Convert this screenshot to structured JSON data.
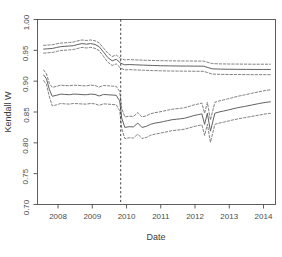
{
  "chart_data": {
    "type": "line",
    "title": "",
    "xlabel": "Date",
    "ylabel": "Kendall W",
    "xlim": [
      2007.4,
      2014.35
    ],
    "ylim": [
      0.7,
      1.0
    ],
    "grid": false,
    "legend": null,
    "x_ticks": [
      2008,
      2009,
      2010,
      2011,
      2012,
      2013,
      2014
    ],
    "x_tick_labels": [
      "2008",
      "2009",
      "2010",
      "2011",
      "2012",
      "2013",
      "2014"
    ],
    "y_ticks": [
      0.7,
      0.75,
      0.8,
      0.85,
      0.9,
      0.95,
      1.0
    ],
    "y_tick_labels": [
      "0.70",
      "0.75",
      "0.80",
      "0.85",
      "0.90",
      "0.95",
      "1.00"
    ],
    "annotations": [
      {
        "type": "vline",
        "x": 2009.83,
        "style": "dashed",
        "color": "#333333"
      }
    ],
    "series": [
      {
        "name": "upper-series-estimate",
        "style": "solid",
        "color": "#5a5a5a",
        "x": [
          2007.58,
          2007.7,
          2007.83,
          2007.95,
          2008.08,
          2008.2,
          2008.33,
          2008.45,
          2008.58,
          2008.7,
          2008.83,
          2008.95,
          2009.08,
          2009.2,
          2009.33,
          2009.45,
          2009.58,
          2009.7,
          2009.83,
          2009.95,
          2010.08,
          2010.25,
          2010.5,
          2010.75,
          2011.0,
          2011.25,
          2011.5,
          2011.75,
          2012.0,
          2012.25,
          2012.5,
          2012.75,
          2013.0,
          2013.25,
          2013.5,
          2013.75,
          2014.0,
          2014.2
        ],
        "y": [
          0.952,
          0.9525,
          0.953,
          0.9545,
          0.956,
          0.9565,
          0.957,
          0.9575,
          0.9595,
          0.961,
          0.96,
          0.961,
          0.9595,
          0.956,
          0.947,
          0.9385,
          0.933,
          0.9355,
          0.929,
          0.9265,
          0.927,
          0.9265,
          0.926,
          0.9255,
          0.925,
          0.9248,
          0.9246,
          0.9245,
          0.9244,
          0.9243,
          0.92,
          0.9195,
          0.9193,
          0.9192,
          0.9191,
          0.919,
          0.919,
          0.919
        ]
      },
      {
        "name": "upper-series-ci-upper",
        "style": "dashed",
        "color": "#6a6a6a",
        "x": [
          2007.58,
          2007.7,
          2007.83,
          2007.95,
          2008.08,
          2008.2,
          2008.33,
          2008.45,
          2008.58,
          2008.7,
          2008.83,
          2008.95,
          2009.08,
          2009.2,
          2009.33,
          2009.45,
          2009.58,
          2009.7,
          2009.83,
          2009.95,
          2010.08,
          2010.25,
          2010.5,
          2010.75,
          2011.0,
          2011.25,
          2011.5,
          2011.75,
          2012.0,
          2012.25,
          2012.5,
          2012.75,
          2013.0,
          2013.25,
          2013.5,
          2013.75,
          2014.0,
          2014.2
        ],
        "y": [
          0.958,
          0.9585,
          0.959,
          0.9605,
          0.9618,
          0.9622,
          0.9628,
          0.9635,
          0.9655,
          0.9668,
          0.966,
          0.9668,
          0.9655,
          0.9622,
          0.9535,
          0.9455,
          0.94,
          0.9425,
          0.9365,
          0.9345,
          0.935,
          0.9345,
          0.934,
          0.9336,
          0.9332,
          0.933,
          0.9328,
          0.9327,
          0.9326,
          0.9325,
          0.9285,
          0.928,
          0.9278,
          0.9277,
          0.9276,
          0.9275,
          0.9275,
          0.9275
        ]
      },
      {
        "name": "upper-series-ci-lower",
        "style": "dashed",
        "color": "#6a6a6a",
        "x": [
          2007.58,
          2007.7,
          2007.83,
          2007.95,
          2008.08,
          2008.2,
          2008.33,
          2008.45,
          2008.58,
          2008.7,
          2008.83,
          2008.95,
          2009.08,
          2009.2,
          2009.33,
          2009.45,
          2009.58,
          2009.7,
          2009.83,
          2009.95,
          2010.08,
          2010.25,
          2010.5,
          2010.75,
          2011.0,
          2011.25,
          2011.5,
          2011.75,
          2012.0,
          2012.25,
          2012.5,
          2012.75,
          2013.0,
          2013.25,
          2013.5,
          2013.75,
          2014.0,
          2014.2
        ],
        "y": [
          0.9455,
          0.946,
          0.9465,
          0.948,
          0.9497,
          0.9502,
          0.9508,
          0.9512,
          0.9532,
          0.9548,
          0.9538,
          0.9548,
          0.9532,
          0.9495,
          0.94,
          0.931,
          0.9255,
          0.928,
          0.921,
          0.9182,
          0.9188,
          0.9182,
          0.9178,
          0.9172,
          0.9168,
          0.9165,
          0.9163,
          0.9162,
          0.9161,
          0.916,
          0.9115,
          0.911,
          0.9108,
          0.9107,
          0.9106,
          0.9105,
          0.9105,
          0.9105
        ]
      },
      {
        "name": "lower-series-estimate",
        "style": "solid",
        "color": "#5a5a5a",
        "x": [
          2007.58,
          2007.66,
          2007.75,
          2007.83,
          2007.95,
          2008.08,
          2008.2,
          2008.33,
          2008.45,
          2008.58,
          2008.7,
          2008.83,
          2008.95,
          2009.08,
          2009.2,
          2009.33,
          2009.45,
          2009.58,
          2009.7,
          2009.8,
          2009.86,
          2009.95,
          2010.08,
          2010.2,
          2010.33,
          2010.45,
          2010.58,
          2010.7,
          2010.83,
          2010.95,
          2011.08,
          2011.2,
          2011.33,
          2011.45,
          2011.58,
          2011.7,
          2011.83,
          2011.95,
          2012.08,
          2012.2,
          2012.28,
          2012.36,
          2012.45,
          2012.58,
          2012.7,
          2012.83,
          2012.95,
          2013.08,
          2013.25,
          2013.45,
          2013.65,
          2013.85,
          2014.05,
          2014.2
        ],
        "y": [
          0.91,
          0.904,
          0.886,
          0.8755,
          0.877,
          0.879,
          0.8785,
          0.878,
          0.879,
          0.8788,
          0.8782,
          0.878,
          0.879,
          0.8785,
          0.876,
          0.8785,
          0.878,
          0.8775,
          0.877,
          0.868,
          0.84,
          0.825,
          0.8262,
          0.8258,
          0.832,
          0.825,
          0.8268,
          0.83,
          0.832,
          0.833,
          0.8345,
          0.836,
          0.8375,
          0.8382,
          0.839,
          0.84,
          0.842,
          0.844,
          0.8455,
          0.847,
          0.83,
          0.848,
          0.819,
          0.848,
          0.85,
          0.8515,
          0.853,
          0.8548,
          0.857,
          0.859,
          0.8612,
          0.8635,
          0.8655,
          0.8665
        ]
      },
      {
        "name": "lower-series-ci-upper",
        "style": "dashed",
        "color": "#6a6a6a",
        "x": [
          2007.58,
          2007.66,
          2007.75,
          2007.83,
          2007.95,
          2008.08,
          2008.2,
          2008.33,
          2008.45,
          2008.58,
          2008.7,
          2008.83,
          2008.95,
          2009.08,
          2009.2,
          2009.33,
          2009.45,
          2009.58,
          2009.7,
          2009.8,
          2009.86,
          2009.95,
          2010.08,
          2010.2,
          2010.33,
          2010.45,
          2010.58,
          2010.7,
          2010.83,
          2010.95,
          2011.08,
          2011.2,
          2011.33,
          2011.45,
          2011.58,
          2011.7,
          2011.83,
          2011.95,
          2012.08,
          2012.2,
          2012.28,
          2012.36,
          2012.45,
          2012.58,
          2012.7,
          2012.83,
          2012.95,
          2013.08,
          2013.25,
          2013.45,
          2013.65,
          2013.85,
          2014.05,
          2014.2
        ],
        "y": [
          0.918,
          0.912,
          0.896,
          0.89,
          0.8915,
          0.8935,
          0.893,
          0.8925,
          0.8935,
          0.8932,
          0.8926,
          0.8924,
          0.8935,
          0.893,
          0.8905,
          0.893,
          0.8925,
          0.892,
          0.8915,
          0.883,
          0.856,
          0.842,
          0.8432,
          0.8428,
          0.849,
          0.842,
          0.8438,
          0.847,
          0.849,
          0.85,
          0.8515,
          0.853,
          0.8545,
          0.8552,
          0.856,
          0.857,
          0.859,
          0.8612,
          0.8628,
          0.8645,
          0.848,
          0.8655,
          0.837,
          0.8658,
          0.8678,
          0.8695,
          0.8712,
          0.873,
          0.8755,
          0.8778,
          0.8802,
          0.8826,
          0.8848,
          0.886
        ]
      },
      {
        "name": "lower-series-ci-lower",
        "style": "dashed",
        "color": "#6a6a6a",
        "x": [
          2007.58,
          2007.66,
          2007.75,
          2007.83,
          2007.95,
          2008.08,
          2008.2,
          2008.33,
          2008.45,
          2008.58,
          2008.7,
          2008.83,
          2008.95,
          2009.08,
          2009.2,
          2009.33,
          2009.45,
          2009.58,
          2009.7,
          2009.8,
          2009.86,
          2009.95,
          2010.08,
          2010.2,
          2010.33,
          2010.45,
          2010.58,
          2010.7,
          2010.83,
          2010.95,
          2011.08,
          2011.2,
          2011.33,
          2011.45,
          2011.58,
          2011.7,
          2011.83,
          2011.95,
          2012.08,
          2012.2,
          2012.28,
          2012.36,
          2012.45,
          2012.58,
          2012.7,
          2012.83,
          2012.95,
          2013.08,
          2013.25,
          2013.45,
          2013.65,
          2013.85,
          2014.05,
          2014.2
        ],
        "y": [
          0.901,
          0.895,
          0.874,
          0.86,
          0.8615,
          0.8638,
          0.8632,
          0.8628,
          0.8638,
          0.8635,
          0.863,
          0.8628,
          0.8638,
          0.8632,
          0.8608,
          0.8632,
          0.8628,
          0.8622,
          0.8618,
          0.852,
          0.823,
          0.807,
          0.8082,
          0.8078,
          0.8142,
          0.807,
          0.8088,
          0.8122,
          0.8142,
          0.8152,
          0.8168,
          0.8182,
          0.8198,
          0.8205,
          0.8212,
          0.8222,
          0.8242,
          0.8262,
          0.8278,
          0.8292,
          0.812,
          0.8302,
          0.801,
          0.83,
          0.832,
          0.8335,
          0.835,
          0.8368,
          0.8388,
          0.8408,
          0.8428,
          0.8448,
          0.8468,
          0.8478
        ]
      }
    ]
  },
  "plot": {
    "box_color": "#4d4d4d",
    "line_color": "#5a5a5a",
    "background": "#ffffff"
  }
}
